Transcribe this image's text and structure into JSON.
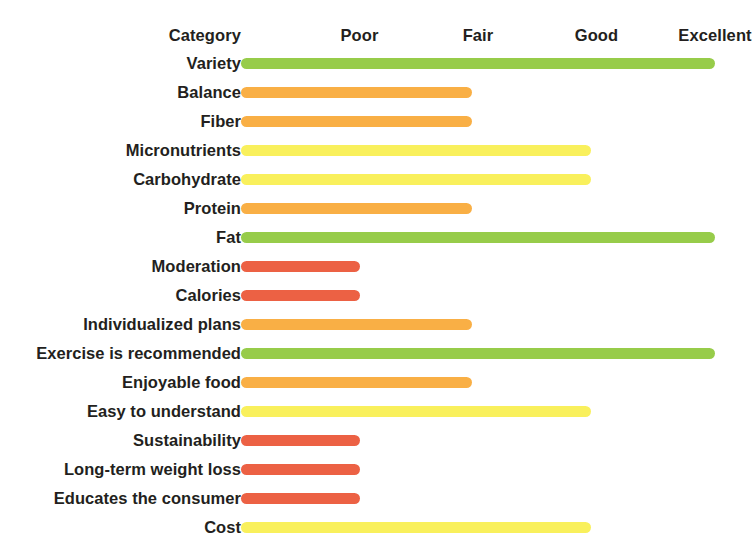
{
  "chart_data": {
    "type": "bar",
    "orientation": "horizontal",
    "title": "",
    "xlabel": "",
    "ylabel": "Category",
    "grid": false,
    "legend": false,
    "category_header": "Category",
    "tick_labels": [
      "Poor",
      "Fair",
      "Good",
      "Excellent"
    ],
    "tick_values": [
      1,
      2,
      3,
      4
    ],
    "xlim": [
      0,
      4.25
    ],
    "categories": [
      "Variety",
      "Balance",
      "Fiber",
      "Micronutrients",
      "Carbohydrate",
      "Protein",
      "Fat",
      "Moderation",
      "Calories",
      "Individualized plans",
      "Exercise is recommended",
      "Enjoyable food",
      "Easy to understand",
      "Sustainability",
      "Long-term weight loss",
      "Educates the consumer",
      "Cost"
    ],
    "values": [
      4.0,
      1.95,
      1.95,
      2.95,
      2.95,
      1.95,
      4.0,
      1.0,
      1.0,
      1.95,
      4.0,
      1.95,
      2.95,
      1.0,
      1.0,
      1.0,
      2.95
    ],
    "ratings": [
      "Excellent",
      "Fair",
      "Fair",
      "Good",
      "Good",
      "Fair",
      "Excellent",
      "Poor",
      "Poor",
      "Fair",
      "Excellent",
      "Fair",
      "Good",
      "Poor",
      "Poor",
      "Poor",
      "Good"
    ],
    "colors": [
      "#97cc4a",
      "#f9af45",
      "#f9af45",
      "#f9f05c",
      "#f9f05c",
      "#f9af45",
      "#97cc4a",
      "#ec6144",
      "#ec6144",
      "#f9af45",
      "#97cc4a",
      "#f9af45",
      "#f9f05c",
      "#ec6144",
      "#ec6144",
      "#ec6144",
      "#f9f05c"
    ],
    "color_scale": {
      "poor": "#ec6144",
      "fair": "#f9af45",
      "good": "#f9f05c",
      "excellent": "#97cc4a"
    }
  }
}
